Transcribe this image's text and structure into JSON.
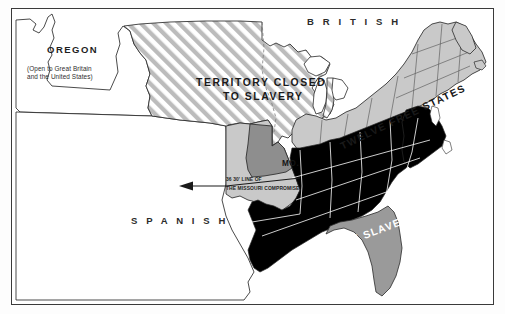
{
  "map": {
    "title": "Missouri Compromise Map",
    "frame": {
      "border_color": "#3a3a3a",
      "background": "#ffffff"
    },
    "palette": {
      "free_states_fill": "#c9c9c9",
      "slave_states_fill": "#000000",
      "territory_fill": "#ffffff",
      "hatch_stripe": "#b8b8b8",
      "missouri_fill": "#8e8e8e",
      "unorganized_fill": "#c9c9c9",
      "florida_fill": "#9a9a9a",
      "outline": "#2a2a2a",
      "internal_border": "#ffffff",
      "text_dark": "#1a1a1a",
      "text_light": "#ffffff"
    },
    "labels": {
      "british": "B R I T I S H",
      "oregon": "OREGON",
      "oregon_note_line1": "(Open to Great Britain",
      "oregon_note_line2": "and the United States)",
      "territory_line1": "TERRITORY CLOSED",
      "territory_line2": "TO SLAVERY",
      "missouri": "MO.",
      "compromise_line1": "36  30' LINE OF",
      "compromise_line2": "THE MISSOURI COMPROMISE",
      "spanish": "S P A N I S H",
      "free_states": "TWELVE FREE STATES",
      "slave_states": "TWELVE SLAVE STATES"
    }
  }
}
